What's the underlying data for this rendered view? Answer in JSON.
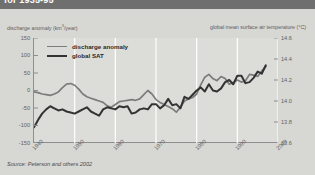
{
  "figure": {
    "title": "for 1935-95",
    "source": "Source: Peterson and others 2002"
  },
  "chart_data": {
    "type": "line",
    "title": "",
    "xlabel": "",
    "ylabel": "discharge anomaly (km3/year)",
    "ylabel_right": "global mean surface air temperature (°C)",
    "xlim": [
      1940,
      2000
    ],
    "ylim": [
      -150,
      150
    ],
    "ylim_right": [
      13.6,
      14.6
    ],
    "grid": true,
    "legend_position": "upper-left",
    "xticks": [
      "1940",
      "1950",
      "1960",
      "1970",
      "1980",
      "1990",
      "2000"
    ],
    "yticks_left": [
      "150",
      "100",
      "50",
      "0",
      "-50",
      "-100",
      "-150"
    ],
    "yticks_right": [
      "14.6",
      "14.4",
      "14.2",
      "14.0",
      "13.8",
      "13.6"
    ],
    "series": [
      {
        "name": "discharge anomaly",
        "color": "#7c7c7c",
        "axis": "left",
        "x": [
          1940,
          1941,
          1942,
          1943,
          1944,
          1945,
          1946,
          1947,
          1948,
          1949,
          1950,
          1951,
          1952,
          1953,
          1954,
          1955,
          1956,
          1957,
          1958,
          1959,
          1960,
          1961,
          1962,
          1963,
          1964,
          1965,
          1966,
          1967,
          1968,
          1969,
          1970,
          1971,
          1972,
          1973,
          1974,
          1975,
          1976,
          1977,
          1978,
          1979,
          1980,
          1981,
          1982,
          1983,
          1984,
          1985,
          1986,
          1987,
          1988,
          1989,
          1990,
          1991,
          1992,
          1993,
          1994,
          1995,
          1996,
          1997
        ],
        "values": [
          -4,
          -6,
          -10,
          -12,
          -14,
          -10,
          -4,
          8,
          18,
          20,
          15,
          4,
          -10,
          -18,
          -22,
          -26,
          -30,
          -34,
          -44,
          -48,
          -40,
          -32,
          -30,
          -28,
          -26,
          -28,
          -24,
          -12,
          0,
          -10,
          -26,
          -34,
          -40,
          -46,
          -52,
          -62,
          -48,
          -30,
          -24,
          -20,
          -10,
          16,
          38,
          46,
          34,
          28,
          40,
          34,
          18,
          22,
          30,
          24,
          28,
          46,
          44,
          40,
          56,
          68
        ]
      },
      {
        "name": "global SAT",
        "color": "#333333",
        "axis": "right",
        "x": [
          1940,
          1941,
          1942,
          1943,
          1944,
          1945,
          1946,
          1947,
          1948,
          1949,
          1950,
          1951,
          1952,
          1953,
          1954,
          1955,
          1956,
          1957,
          1958,
          1959,
          1960,
          1961,
          1962,
          1963,
          1964,
          1965,
          1966,
          1967,
          1968,
          1969,
          1970,
          1971,
          1972,
          1973,
          1974,
          1975,
          1976,
          1977,
          1978,
          1979,
          1980,
          1981,
          1982,
          1983,
          1984,
          1985,
          1986,
          1987,
          1988,
          1989,
          1990,
          1991,
          1992,
          1993,
          1994,
          1995,
          1996,
          1997
        ],
        "values": [
          13.75,
          13.82,
          13.88,
          13.92,
          13.95,
          13.93,
          13.91,
          13.92,
          13.9,
          13.89,
          13.88,
          13.9,
          13.92,
          13.94,
          13.9,
          13.88,
          13.86,
          13.92,
          13.94,
          13.93,
          13.92,
          13.95,
          13.94,
          13.95,
          13.88,
          13.89,
          13.92,
          13.93,
          13.92,
          13.97,
          13.97,
          13.93,
          13.96,
          14.02,
          13.96,
          13.97,
          13.93,
          14.04,
          14.02,
          14.06,
          14.1,
          14.13,
          14.09,
          14.16,
          14.1,
          14.09,
          14.12,
          14.18,
          14.2,
          14.16,
          14.24,
          14.24,
          14.17,
          14.18,
          14.22,
          14.28,
          14.26,
          14.34
        ]
      }
    ]
  },
  "legend": {
    "items": [
      {
        "label": "discharge anomaly"
      },
      {
        "label": "global SAT"
      }
    ]
  }
}
